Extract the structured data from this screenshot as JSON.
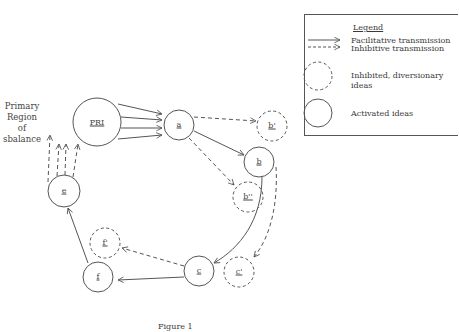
{
  "figure": {
    "caption": "Figure 1",
    "side_label": [
      "Primary",
      "Region",
      "of",
      "Imbalance"
    ],
    "side_label_visible": [
      "Primary",
      "Region",
      "of",
      "sbalance"
    ]
  },
  "legend": {
    "title": "Legend",
    "items": [
      {
        "symbol": "solid-arrow",
        "label": "Facilitative transmission"
      },
      {
        "symbol": "dashed-arrow",
        "label": "Inhibitive transmission"
      },
      {
        "symbol": "dashed-circle",
        "label": "Inhibited, diversionary ideas"
      },
      {
        "symbol": "solid-circle",
        "label": "Activated ideas"
      }
    ]
  },
  "nodes": [
    {
      "id": "PRI",
      "label": "PRI",
      "type": "activated"
    },
    {
      "id": "a",
      "label": "a",
      "type": "activated"
    },
    {
      "id": "b_prime",
      "label": "b'",
      "type": "inhibited"
    },
    {
      "id": "b",
      "label": "b",
      "type": "activated"
    },
    {
      "id": "b_dprime",
      "label": "b''",
      "type": "inhibited"
    },
    {
      "id": "c",
      "label": "c",
      "type": "activated"
    },
    {
      "id": "c_prime",
      "label": "c'",
      "type": "inhibited"
    },
    {
      "id": "f",
      "label": "f",
      "type": "activated"
    },
    {
      "id": "f_prime",
      "label": "f'",
      "type": "inhibited"
    },
    {
      "id": "e",
      "label": "e",
      "type": "activated"
    }
  ],
  "edges": [
    {
      "from": "PRI",
      "to": "a",
      "style": "facilitative",
      "count": 4
    },
    {
      "from": "a",
      "to": "b_prime",
      "style": "inhibitive"
    },
    {
      "from": "a",
      "to": "b",
      "style": "facilitative"
    },
    {
      "from": "a",
      "to": "b_dprime",
      "style": "inhibitive"
    },
    {
      "from": "b",
      "to": "c",
      "style": "facilitative"
    },
    {
      "from": "b",
      "to": "c_prime",
      "style": "inhibitive"
    },
    {
      "from": "c",
      "to": "f",
      "style": "facilitative"
    },
    {
      "from": "c",
      "to": "f_prime",
      "style": "inhibitive"
    },
    {
      "from": "f",
      "to": "e",
      "style": "facilitative"
    },
    {
      "from": "e",
      "to": "PRI",
      "style": "inhibitive",
      "count": 4
    }
  ],
  "colors": {
    "stroke": "#555555",
    "text": "#444444",
    "background": "#ffffff"
  }
}
